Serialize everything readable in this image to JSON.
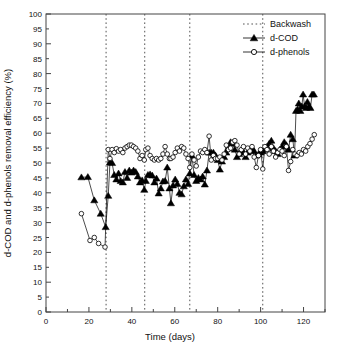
{
  "chart_data": {
    "type": "scatter",
    "title": "",
    "xlabel": "Time (days)",
    "ylabel": "d-COD and d-phenols removal efficiency (%)",
    "xlim": [
      0,
      130
    ],
    "ylim": [
      0,
      100
    ],
    "x_major_ticks": [
      0,
      20,
      40,
      60,
      80,
      100,
      120
    ],
    "x_tick_labels": [
      "0",
      "20",
      "40",
      "60",
      "80",
      "100",
      "120"
    ],
    "x_minor_interval": 10,
    "y_major_ticks": [
      0,
      5,
      10,
      15,
      20,
      25,
      30,
      35,
      40,
      45,
      50,
      55,
      60,
      65,
      70,
      75,
      80,
      85,
      90,
      95,
      100
    ],
    "y_tick_labels": [
      "0",
      "5",
      "10",
      "15",
      "20",
      "25",
      "30",
      "35",
      "40",
      "45",
      "50",
      "55",
      "60",
      "65",
      "70",
      "75",
      "80",
      "85",
      "90",
      "95",
      "100"
    ],
    "grid": false,
    "legend_position": "top-right",
    "legend": [
      {
        "label": "Backwash",
        "style": "dotted-line",
        "color": "#000000"
      },
      {
        "label": "d-COD",
        "style": "filled-triangle-line",
        "color": "#000000"
      },
      {
        "label": "d-phenols",
        "style": "open-circle-line",
        "color": "#000000"
      }
    ],
    "annotations": [
      {
        "type": "vline",
        "label": "Backwash",
        "x": 28
      },
      {
        "type": "vline",
        "label": "Backwash",
        "x": 46
      },
      {
        "type": "vline",
        "label": "Backwash",
        "x": 67
      },
      {
        "type": "vline",
        "label": "Backwash",
        "x": 101
      }
    ],
    "series": [
      {
        "name": "d-COD",
        "marker": "filled-triangle",
        "color": "#000000",
        "points": [
          [
            16.5,
            45.2
          ],
          [
            19.5,
            45.3
          ],
          [
            22.5,
            37.5
          ],
          [
            25.5,
            33.0
          ],
          [
            27.8,
            28.5
          ],
          [
            29.0,
            39.0
          ],
          [
            29.8,
            50.2
          ],
          [
            30.8,
            50.0
          ],
          [
            31.8,
            46.0
          ],
          [
            32.8,
            44.5
          ],
          [
            33.8,
            46.5
          ],
          [
            34.8,
            44.0
          ],
          [
            35.8,
            43.5
          ],
          [
            36.8,
            47.0
          ],
          [
            37.8,
            45.0
          ],
          [
            38.8,
            47.5
          ],
          [
            39.8,
            46.8
          ],
          [
            40.8,
            47.5
          ],
          [
            41.8,
            47.0
          ],
          [
            42.8,
            45.5
          ],
          [
            43.8,
            43.5
          ],
          [
            44.8,
            44.2
          ],
          [
            45.8,
            41.0
          ],
          [
            46.5,
            44.0
          ],
          [
            47.5,
            46.0
          ],
          [
            48.5,
            46.2
          ],
          [
            49.5,
            45.8
          ],
          [
            50.5,
            43.5
          ],
          [
            51.5,
            44.8
          ],
          [
            52.5,
            39.8
          ],
          [
            53.5,
            41.5
          ],
          [
            54.5,
            43.8
          ],
          [
            55.5,
            44.0
          ],
          [
            56.5,
            48.5
          ],
          [
            57.5,
            41.5
          ],
          [
            58.2,
            36.5
          ],
          [
            59.2,
            42.5
          ],
          [
            60.2,
            44.5
          ],
          [
            61.2,
            43.0
          ],
          [
            62.2,
            40.0
          ],
          [
            63.2,
            39.5
          ],
          [
            64.2,
            42.2
          ],
          [
            65.2,
            44.5
          ],
          [
            66.2,
            43.0
          ],
          [
            67.0,
            46.5
          ],
          [
            68.0,
            52.5
          ],
          [
            69.0,
            46.0
          ],
          [
            70.0,
            44.0
          ],
          [
            71.0,
            45.0
          ],
          [
            72.0,
            44.5
          ],
          [
            73.0,
            45.5
          ],
          [
            74.0,
            42.8
          ],
          [
            75.0,
            47.5
          ],
          [
            76.0,
            53.5
          ],
          [
            77.0,
            53.5
          ],
          [
            78.0,
            53.5
          ],
          [
            79.0,
            52.5
          ],
          [
            80.0,
            51.0
          ],
          [
            81.0,
            47.8
          ],
          [
            82.0,
            50.5
          ],
          [
            83.0,
            52.0
          ],
          [
            84.0,
            53.5
          ],
          [
            85.0,
            55.0
          ],
          [
            86.0,
            57.0
          ],
          [
            87.0,
            56.5
          ],
          [
            88.0,
            54.5
          ],
          [
            89.0,
            52.0
          ],
          [
            90.0,
            53.0
          ],
          [
            91.0,
            54.0
          ],
          [
            92.0,
            53.5
          ],
          [
            93.0,
            52.0
          ],
          [
            94.0,
            53.5
          ],
          [
            95.0,
            54.5
          ],
          [
            96.0,
            55.0
          ],
          [
            97.0,
            54.0
          ],
          [
            98.0,
            52.5
          ],
          [
            99.0,
            53.0
          ],
          [
            100.0,
            53.5
          ],
          [
            101.0,
            54.0
          ],
          [
            102.0,
            54.5
          ],
          [
            103.0,
            55.5
          ],
          [
            104.0,
            56.5
          ],
          [
            105.0,
            57.5
          ],
          [
            106.0,
            55.0
          ],
          [
            107.0,
            54.0
          ],
          [
            108.0,
            53.0
          ],
          [
            109.0,
            54.5
          ],
          [
            110.0,
            55.5
          ],
          [
            111.0,
            57.0
          ],
          [
            112.0,
            56.0
          ],
          [
            113.0,
            54.5
          ],
          [
            114.0,
            59.5
          ],
          [
            115.0,
            58.0
          ],
          [
            115.8,
            52.5
          ],
          [
            116.5,
            67.5
          ],
          [
            117.2,
            68.0
          ],
          [
            117.8,
            70.0
          ],
          [
            118.5,
            67.5
          ],
          [
            119.2,
            69.0
          ],
          [
            119.8,
            73.0
          ],
          [
            120.5,
            69.0
          ],
          [
            121.2,
            68.5
          ],
          [
            121.8,
            70.5
          ],
          [
            122.5,
            69.0
          ],
          [
            123.2,
            68.5
          ],
          [
            124.0,
            73.0
          ],
          [
            124.8,
            73.0
          ]
        ]
      },
      {
        "name": "d-phenols",
        "marker": "open-circle",
        "color": "#000000",
        "points": [
          [
            16.5,
            33.0
          ],
          [
            20.5,
            24.0
          ],
          [
            22.5,
            25.0
          ],
          [
            24.5,
            23.0
          ],
          [
            27.5,
            21.8
          ],
          [
            29.0,
            54.5
          ],
          [
            29.8,
            51.5
          ],
          [
            30.8,
            54.5
          ],
          [
            31.8,
            53.5
          ],
          [
            32.8,
            54.8
          ],
          [
            33.8,
            54.0
          ],
          [
            34.8,
            54.5
          ],
          [
            35.8,
            53.5
          ],
          [
            36.8,
            55.0
          ],
          [
            37.8,
            55.5
          ],
          [
            38.8,
            56.0
          ],
          [
            39.8,
            56.0
          ],
          [
            40.8,
            55.5
          ],
          [
            41.8,
            55.0
          ],
          [
            42.8,
            54.0
          ],
          [
            43.8,
            51.5
          ],
          [
            44.8,
            52.5
          ],
          [
            45.8,
            51.0
          ],
          [
            46.5,
            54.5
          ],
          [
            47.5,
            55.0
          ],
          [
            48.5,
            52.5
          ],
          [
            49.5,
            51.5
          ],
          [
            50.5,
            51.0
          ],
          [
            51.5,
            51.5
          ],
          [
            52.5,
            51.0
          ],
          [
            53.5,
            51.5
          ],
          [
            54.5,
            53.0
          ],
          [
            55.5,
            55.5
          ],
          [
            56.5,
            53.0
          ],
          [
            57.5,
            51.5
          ],
          [
            58.2,
            51.5
          ],
          [
            59.2,
            52.0
          ],
          [
            60.2,
            53.5
          ],
          [
            61.2,
            55.0
          ],
          [
            62.2,
            54.0
          ],
          [
            63.2,
            55.5
          ],
          [
            64.2,
            55.0
          ],
          [
            65.2,
            53.0
          ],
          [
            66.2,
            51.5
          ],
          [
            67.0,
            48.5
          ],
          [
            68.0,
            53.0
          ],
          [
            69.0,
            51.0
          ],
          [
            70.0,
            49.0
          ],
          [
            71.0,
            52.0
          ],
          [
            72.0,
            54.0
          ],
          [
            73.0,
            53.5
          ],
          [
            74.0,
            54.5
          ],
          [
            75.0,
            53.5
          ],
          [
            76.0,
            59.0
          ],
          [
            77.0,
            51.0
          ],
          [
            78.0,
            52.5
          ],
          [
            79.0,
            51.5
          ],
          [
            80.0,
            51.5
          ],
          [
            81.0,
            52.0
          ],
          [
            82.0,
            51.0
          ],
          [
            83.0,
            53.0
          ],
          [
            84.0,
            56.0
          ],
          [
            85.0,
            54.5
          ],
          [
            86.0,
            55.0
          ],
          [
            87.0,
            57.0
          ],
          [
            88.0,
            57.5
          ],
          [
            89.0,
            56.0
          ],
          [
            90.0,
            53.0
          ],
          [
            91.0,
            54.5
          ],
          [
            92.0,
            55.5
          ],
          [
            93.0,
            53.0
          ],
          [
            94.0,
            55.0
          ],
          [
            95.0,
            54.0
          ],
          [
            96.0,
            55.5
          ],
          [
            97.0,
            52.0
          ],
          [
            98.0,
            48.5
          ],
          [
            99.0,
            52.5
          ],
          [
            100.0,
            54.5
          ],
          [
            101.0,
            48.0
          ],
          [
            102.0,
            55.5
          ],
          [
            103.0,
            54.5
          ],
          [
            104.0,
            53.0
          ],
          [
            105.0,
            55.5
          ],
          [
            106.0,
            54.0
          ],
          [
            107.0,
            52.0
          ],
          [
            108.0,
            53.5
          ],
          [
            109.0,
            54.5
          ],
          [
            110.0,
            54.0
          ],
          [
            111.0,
            52.5
          ],
          [
            112.0,
            55.5
          ],
          [
            113.0,
            47.5
          ],
          [
            114.0,
            50.5
          ],
          [
            115.0,
            54.5
          ],
          [
            116.0,
            53.0
          ],
          [
            117.0,
            52.5
          ],
          [
            118.0,
            53.5
          ],
          [
            119.0,
            53.0
          ],
          [
            120.0,
            54.5
          ],
          [
            121.0,
            54.0
          ],
          [
            122.0,
            55.5
          ],
          [
            123.0,
            56.5
          ],
          [
            124.0,
            58.0
          ],
          [
            125.0,
            59.5
          ]
        ]
      }
    ]
  }
}
